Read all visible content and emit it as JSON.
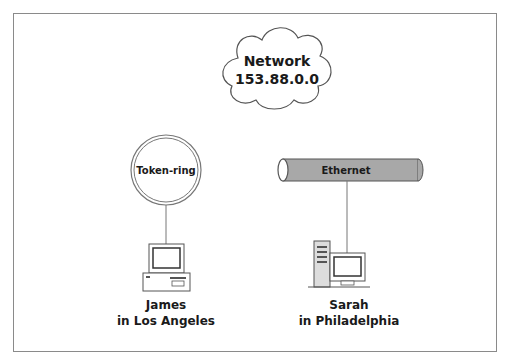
{
  "diagram": {
    "type": "network-diagram",
    "cloud": {
      "line1": "Network",
      "line2": "153.88.0.0"
    },
    "token_ring": {
      "label": "Token-ring"
    },
    "ethernet": {
      "label": "Ethernet"
    },
    "hosts": [
      {
        "name": "James",
        "location": "in Los Angeles",
        "computer": "desktop-pc",
        "connected_to": "Token-ring"
      },
      {
        "name": "Sarah",
        "location": "in Philadelphia",
        "computer": "tower-pc",
        "connected_to": "Ethernet"
      }
    ],
    "colors": {
      "stroke": "#555555",
      "ethernet_fill": "#a8a8a8",
      "frame": "#8a8a8a",
      "text": "#1a1a1a"
    }
  }
}
